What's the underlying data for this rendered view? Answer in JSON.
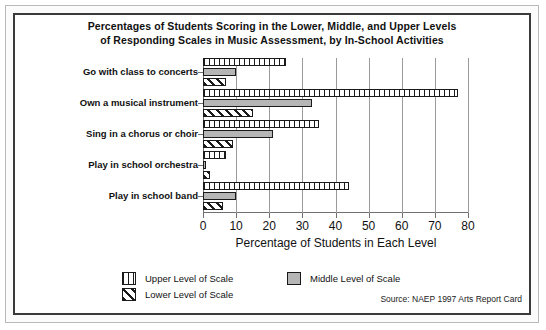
{
  "chart_data": {
    "type": "bar",
    "orientation": "horizontal",
    "title": "Percentages of Students Scoring in the Lower, Middle, and Upper Levels of Responding Scales in Music Assessment, by In-School Activities",
    "title_line1": "Percentages of Students Scoring in the Lower, Middle, and Upper Levels",
    "title_line2": "of Responding Scales in Music Assessment, by In-School Activities",
    "xlabel": "Percentage of Students in Each Level",
    "ylabel": "",
    "xlim": [
      0,
      80
    ],
    "xticks": [
      0,
      10,
      20,
      30,
      40,
      50,
      60,
      70,
      80
    ],
    "xtick_labels": [
      "0",
      "10",
      "20",
      "30",
      "40",
      "50",
      "60",
      "70",
      "80"
    ],
    "grid": "vertical",
    "legend_position": "bottom",
    "categories": [
      "Go with class to concerts",
      "Own a musical instrument",
      "Sing in a chorus or choir",
      "Play in school orchestra",
      "Play in school band"
    ],
    "series": [
      {
        "name": "Upper Level of Scale",
        "pattern": "vertical-lines",
        "color": "#ffffff",
        "values": [
          25,
          77,
          35,
          7,
          44
        ]
      },
      {
        "name": "Middle Level of Scale",
        "pattern": "solid-gray",
        "color": "#b6b6b6",
        "values": [
          10,
          33,
          21,
          1,
          10
        ]
      },
      {
        "name": "Lower Level of Scale",
        "pattern": "diagonal-hatch",
        "color": "#ffffff",
        "values": [
          7,
          15,
          9,
          2,
          6
        ]
      }
    ],
    "annotations": [
      "Source: NAEP 1997 Arts Report Card"
    ]
  },
  "legend": {
    "upper_label": "Upper Level of Scale",
    "middle_label": "Middle Level of Scale",
    "lower_label": "Lower Level of Scale"
  },
  "source": "Source: NAEP 1997 Arts Report Card",
  "colors": {
    "middle_fill": "#b6b6b6",
    "bar_outline": "#1a1a1a",
    "grid": "#9a9a9a",
    "axis": "#6f6f6f",
    "frame": "#3a3a3a",
    "text": "#111111",
    "background": "#ffffff"
  }
}
